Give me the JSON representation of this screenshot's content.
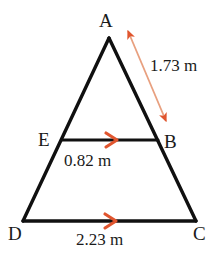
{
  "figure": {
    "background_color": "#ffffff",
    "stroke_color": "#101010",
    "arrow_color": "#e0552e",
    "arrow_line_color": "#e8a07f",
    "vertices": [
      {
        "id": "A",
        "label": "A",
        "x": 109,
        "y": 38
      },
      {
        "id": "B",
        "label": "B",
        "x": 158,
        "y": 140
      },
      {
        "id": "C",
        "label": "C",
        "x": 196,
        "y": 221
      },
      {
        "id": "D",
        "label": "D",
        "x": 23,
        "y": 221
      },
      {
        "id": "E",
        "label": "E",
        "x": 62,
        "y": 140
      }
    ],
    "segments": [
      {
        "id": "AD",
        "from": "A",
        "to": "D",
        "kind": "triangle-side"
      },
      {
        "id": "AC",
        "from": "A",
        "to": "C",
        "kind": "triangle-side"
      },
      {
        "id": "DC",
        "from": "D",
        "to": "C",
        "kind": "base",
        "parallel_marks": 1
      },
      {
        "id": "EB",
        "from": "E",
        "to": "B",
        "kind": "midsegment",
        "parallel_marks": 1
      }
    ],
    "measurements": [
      {
        "id": "ab",
        "segment": "AB",
        "text": "1.73 m",
        "value": 1.73,
        "unit": "m",
        "annotation": "double-headed-arrow"
      },
      {
        "id": "eb",
        "segment": "EB",
        "text": "0.82 m",
        "value": 0.82,
        "unit": "m",
        "annotation": "parallel-arrowhead"
      },
      {
        "id": "dc",
        "segment": "DC",
        "text": "2.23 m",
        "value": 2.23,
        "unit": "m",
        "annotation": "parallel-arrowhead"
      }
    ]
  }
}
